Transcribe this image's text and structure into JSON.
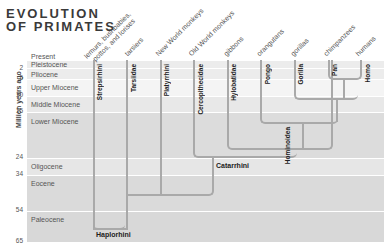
{
  "title": {
    "line1": "EVOLUTION",
    "line2": "OF PRIMATES"
  },
  "y_axis_label": "Million years ago",
  "ticks": [
    "2",
    "5",
    "10",
    "15",
    "24",
    "34",
    "54",
    "65"
  ],
  "eras": [
    "Present",
    "Pleistocene",
    "Pliocene",
    "Upper Miocene",
    "Middle Miocene",
    "Lower Miocene",
    "Oligocene",
    "Eocene",
    "Paleocene"
  ],
  "common_names": [
    "lemurs, bushbabies,",
    "pottos, and lorises",
    "tarsiers",
    "New World monkeys",
    "Old World monkeys",
    "gibbons",
    "orangutans",
    "gorillas",
    "chimpanzees",
    "humans"
  ],
  "taxa": [
    "Strepsirhini",
    "Tarsiidae",
    "Platyrrhini",
    "Cercopithecidae",
    "Hylobatidae",
    "Pongo",
    "Gorilla",
    "Pan",
    "Homo"
  ],
  "clades": {
    "haplorhini": "Haplorhini",
    "catarrhini": "Catarrhini",
    "hominoidea": "Hominoidea"
  },
  "colors": {
    "line": "#a9a9a9",
    "band_light": "#f1f1f1",
    "band_mid": "#e6e6e6",
    "band_dark": "#dadada"
  }
}
